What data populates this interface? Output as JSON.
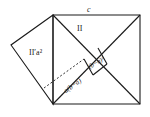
{
  "diagram": {
    "labels": {
      "top_side": "c",
      "region_II": "II",
      "region_II_prime": "II′a²",
      "inner_square": "(b−a)²",
      "rectangle": "a(b−a)"
    }
  }
}
